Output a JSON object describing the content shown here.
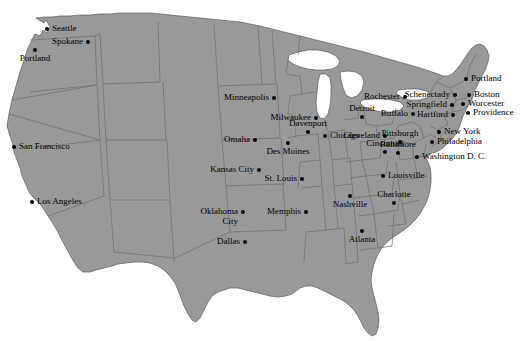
{
  "map": {
    "title": "United States major cities map",
    "colors": {
      "land": "#999999",
      "water": "#ffffff",
      "background": "#ffffff",
      "border": "#5a5a5a",
      "state_border": "#6b6b6b",
      "city_dot": "#000000",
      "label_text": "#000000"
    },
    "cities": [
      {
        "name": "Seattle",
        "x": 47,
        "y": 29,
        "label_pos": "right"
      },
      {
        "name": "Spokane",
        "x": 88,
        "y": 42,
        "label_pos": "left"
      },
      {
        "name": "Portland",
        "x": 35,
        "y": 50,
        "label_pos": "below-c"
      },
      {
        "name": "San Francisco",
        "x": 14,
        "y": 147,
        "label_pos": "right"
      },
      {
        "name": "Los Angeles",
        "x": 32,
        "y": 202,
        "label_pos": "right"
      },
      {
        "name": "Minneapolis",
        "x": 274,
        "y": 98,
        "label_pos": "left"
      },
      {
        "name": "Milwaukee",
        "x": 316,
        "y": 118,
        "label_pos": "left"
      },
      {
        "name": "Davenport",
        "x": 308,
        "y": 132,
        "label_pos": "above-c"
      },
      {
        "name": "Des Moines",
        "x": 288,
        "y": 143,
        "label_pos": "below-c"
      },
      {
        "name": "Omaha",
        "x": 255,
        "y": 140,
        "label_pos": "left"
      },
      {
        "name": "Chicago",
        "x": 325,
        "y": 136,
        "label_pos": "right"
      },
      {
        "name": "Detroit",
        "x": 362,
        "y": 117,
        "label_pos": "above-c"
      },
      {
        "name": "Cleveland",
        "x": 385,
        "y": 136,
        "label_pos": "left"
      },
      {
        "name": "Cincinnati",
        "x": 385,
        "y": 152,
        "label_pos": "above-c"
      },
      {
        "name": "Kansas City",
        "x": 259,
        "y": 170,
        "label_pos": "left"
      },
      {
        "name": "St. Louis",
        "x": 302,
        "y": 179,
        "label_pos": "left"
      },
      {
        "name": "Louisville",
        "x": 383,
        "y": 176,
        "label_pos": "right"
      },
      {
        "name": "Oklahoma\nCity",
        "x": 243,
        "y": 212,
        "label_pos": "left"
      },
      {
        "name": "Memphis",
        "x": 306,
        "y": 212,
        "label_pos": "left"
      },
      {
        "name": "Nashville",
        "x": 350,
        "y": 196,
        "label_pos": "below-c"
      },
      {
        "name": "Dallas",
        "x": 245,
        "y": 242,
        "label_pos": "left"
      },
      {
        "name": "Atlanta",
        "x": 362,
        "y": 231,
        "label_pos": "below-c"
      },
      {
        "name": "Charlotte",
        "x": 394,
        "y": 203,
        "label_pos": "above-c"
      },
      {
        "name": "Rochester",
        "x": 405,
        "y": 97,
        "label_pos": "left"
      },
      {
        "name": "Schenectady",
        "x": 455,
        "y": 95,
        "label_pos": "left"
      },
      {
        "name": "Buffalo",
        "x": 413,
        "y": 114,
        "label_pos": "left"
      },
      {
        "name": "Springfield",
        "x": 452,
        "y": 105,
        "label_pos": "left"
      },
      {
        "name": "Hartford",
        "x": 453,
        "y": 115,
        "label_pos": "left"
      },
      {
        "name": "Portland",
        "x": 466,
        "y": 79,
        "label_pos": "right"
      },
      {
        "name": "Boston",
        "x": 469,
        "y": 95,
        "label_pos": "right"
      },
      {
        "name": "Worcester",
        "x": 463,
        "y": 104,
        "label_pos": "right"
      },
      {
        "name": "Providence",
        "x": 468,
        "y": 113,
        "label_pos": "right"
      },
      {
        "name": "New York",
        "x": 439,
        "y": 132,
        "label_pos": "right"
      },
      {
        "name": "Philadelphia",
        "x": 432,
        "y": 142,
        "label_pos": "right"
      },
      {
        "name": "Pittsburgh",
        "x": 400,
        "y": 142,
        "label_pos": "above-c"
      },
      {
        "name": "Baltimore",
        "x": 398,
        "y": 153,
        "label_pos": "above-c"
      },
      {
        "name": "Washington D. C.",
        "x": 417,
        "y": 157,
        "label_pos": "right"
      }
    ]
  }
}
